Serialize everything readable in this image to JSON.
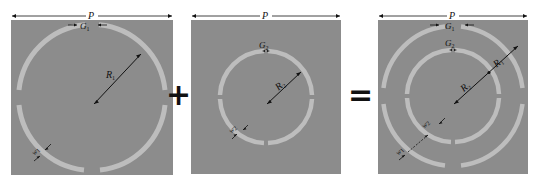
{
  "colors": {
    "substrate": "#8c8c8c",
    "ring": "#bdbdbd",
    "annotation": "#111111",
    "background": "#ffffff"
  },
  "operators": {
    "plus": "+",
    "equals": "="
  },
  "panels": [
    {
      "name": "outer-split-ring",
      "period_label": "P",
      "gap_label": "G",
      "gap_sub": "1",
      "radius_label": "R",
      "radius_sub": "1",
      "width_label": "w",
      "width_sub": "1"
    },
    {
      "name": "inner-split-ring",
      "period_label": "P",
      "gap_label": "G",
      "gap_sub": "2",
      "radius_label": "R",
      "radius_sub": "2",
      "width_label": "w",
      "width_sub": "2"
    },
    {
      "name": "combined-double-split-ring",
      "period_label": "P",
      "gap1_label": "G",
      "gap1_sub": "1",
      "gap2_label": "G",
      "gap2_sub": "2",
      "radius1_label": "R",
      "radius1_sub": "1",
      "radius2_label": "R",
      "radius2_sub": "2",
      "width1_label": "w",
      "width1_sub": "1",
      "width2_label": "w",
      "width2_sub": "2"
    }
  ]
}
